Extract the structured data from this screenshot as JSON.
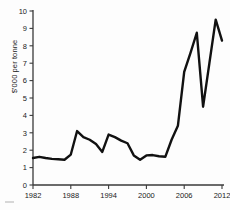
{
  "chart_data": {
    "type": "line",
    "title": "",
    "subtitle": "",
    "xlabel": "",
    "ylabel": "$'000 per tonne",
    "xlim": [
      1982,
      2012
    ],
    "ylim": [
      0,
      10
    ],
    "grid": false,
    "legend": null,
    "y_ticks": [
      0,
      1,
      2,
      3,
      4,
      5,
      6,
      7,
      8,
      9,
      10
    ],
    "y_tick_labels": [
      "0",
      "1",
      "2",
      "3",
      "4",
      "5",
      "6",
      "7",
      "8",
      "9",
      "10"
    ],
    "x_ticks": [
      1982,
      1988,
      1994,
      2000,
      2006,
      2012
    ],
    "x_tick_labels": [
      "1982",
      "1988",
      "1994",
      "2000",
      "2006",
      "2012"
    ],
    "line_color": "#111111",
    "line_width": 2.4,
    "series": [
      {
        "name": "price",
        "x": [
          1982,
          1983,
          1984,
          1985,
          1986,
          1987,
          1988,
          1989,
          1990,
          1991,
          1992,
          1993,
          1994,
          1995,
          1996,
          1997,
          1998,
          1999,
          2000,
          2001,
          2002,
          2003,
          2004,
          2005,
          2006,
          2007,
          2008,
          2009,
          2010,
          2011,
          2012
        ],
        "values": [
          1.55,
          1.62,
          1.55,
          1.5,
          1.48,
          1.45,
          1.75,
          3.1,
          2.75,
          2.6,
          2.35,
          1.9,
          2.9,
          2.75,
          2.55,
          2.4,
          1.7,
          1.45,
          1.7,
          1.72,
          1.65,
          1.62,
          2.6,
          3.4,
          6.5,
          7.6,
          8.75,
          4.5,
          7.0,
          9.5,
          8.3
        ]
      }
    ]
  },
  "axis": {
    "y_title": "$'000 per tonne"
  }
}
